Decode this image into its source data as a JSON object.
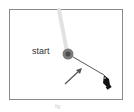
{
  "diagram": {
    "start_label": "start",
    "caption": "fig",
    "colors": {
      "frame": "#8a8a8a",
      "point": "#7a7a7a",
      "point_center": "#4a4a4a",
      "trail": "#e2e2e2",
      "segment": "#555555",
      "arrow": "#555555",
      "cursor": "#111111"
    }
  }
}
